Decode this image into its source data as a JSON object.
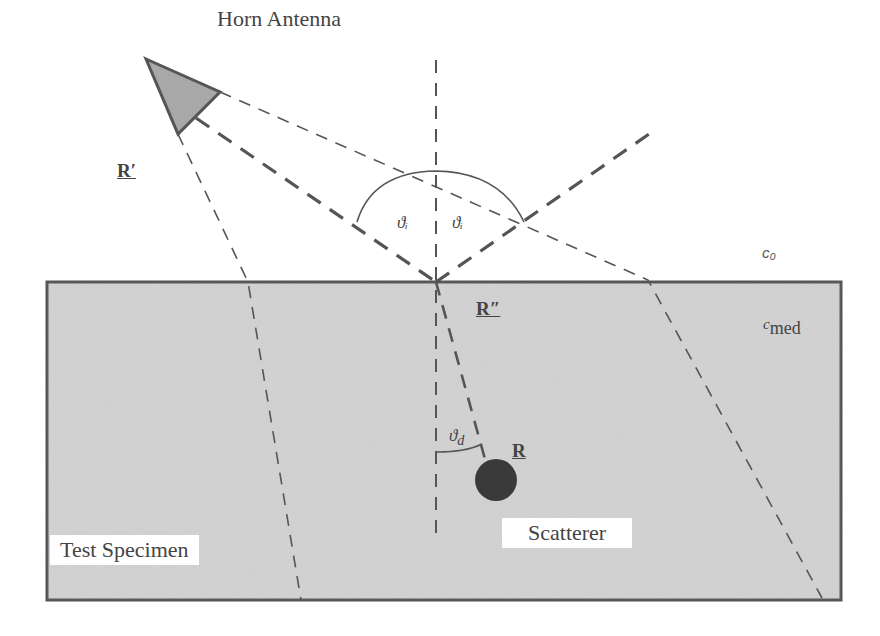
{
  "diagram": {
    "title": "Horn Antenna",
    "colors": {
      "specimen_fill": "#d2d2d2",
      "specimen_border": "#555555",
      "horn_fill": "#a8a8a8",
      "scatterer_fill": "#3a3a3a",
      "line_color": "#555555",
      "background": "#ffffff"
    },
    "labels": {
      "horn_antenna": "Horn Antenna",
      "test_specimen": "Test Specimen",
      "scatterer": "Scatterer",
      "r_prime": "R′",
      "r_double_prime": "R″",
      "r": "R",
      "theta_i_left": "ϑᵢ",
      "theta_i_right": "ϑᵢ",
      "theta_d": "ϑ",
      "theta_d_sub": "d",
      "c0": "c₀",
      "cmed_c": "c",
      "cmed_sub": "med"
    },
    "geometry": {
      "specimen_box": {
        "x": 47,
        "y": 282,
        "width": 794,
        "height": 318
      },
      "horn": [
        [
          146,
          59
        ],
        [
          220,
          92
        ],
        [
          178,
          134
        ]
      ],
      "normal_line": {
        "x": 436,
        "y1": 60,
        "y2": 535
      },
      "incidence_point": [
        436,
        282
      ],
      "scatterer_center": [
        496,
        480
      ],
      "scatterer_radius": 21
    }
  }
}
